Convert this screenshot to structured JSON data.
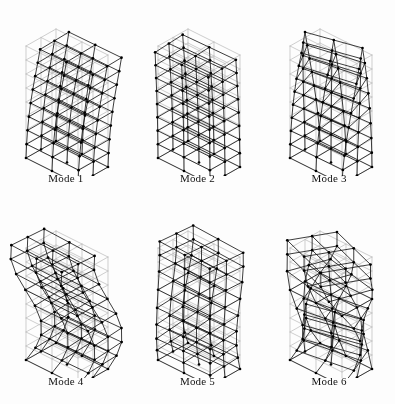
{
  "figure": {
    "type": "mode-shape-grid",
    "columns": 3,
    "rows": 2,
    "background_color": "#fdfdfd",
    "deformed_color": "#1a1a1a",
    "undeformed_color": "#b9b9b9",
    "node_color": "#000000"
  },
  "structure": {
    "description": "three-dimensional multi-storey building frame",
    "storeys": 8,
    "bays_x": 2,
    "bays_y": 2,
    "columns_per_floor": 9,
    "projection": "isometric"
  },
  "panels": [
    {
      "id": "mode-1",
      "label": "Mode 1",
      "shape": "first translational sway",
      "amp": 1.0,
      "kind": "sway",
      "dir_x": 1.0,
      "dir_y": 0.12,
      "twist": 0.05,
      "curve": 0.55,
      "phase": 0
    },
    {
      "id": "mode-2",
      "label": "Mode 2",
      "shape": "second translational sway",
      "amp": 1.0,
      "kind": "sway",
      "dir_x": 0.25,
      "dir_y": -1.0,
      "twist": 0.1,
      "curve": 0.55,
      "phase": 0
    },
    {
      "id": "mode-3",
      "label": "Mode 3",
      "shape": "first torsional",
      "amp": 0.72,
      "kind": "torsion",
      "dir_x": 0.08,
      "dir_y": 0.05,
      "twist": 1.0,
      "curve": 0.85,
      "phase": 0
    },
    {
      "id": "mode-4",
      "label": "Mode 4",
      "shape": "second mode sway with reversal",
      "amp": 1.0,
      "kind": "sway2",
      "dir_x": 0.95,
      "dir_y": 0.3,
      "twist": 0.12,
      "curve": 0.5,
      "phase": 1
    },
    {
      "id": "mode-5",
      "label": "Mode 5",
      "shape": "second mode sway transverse",
      "amp": 1.0,
      "kind": "sway2",
      "dir_x": 0.3,
      "dir_y": -0.95,
      "twist": 0.15,
      "curve": 0.5,
      "phase": 1
    },
    {
      "id": "mode-6",
      "label": "Mode 6",
      "shape": "second torsional",
      "amp": 0.8,
      "kind": "torsion2",
      "dir_x": 0.15,
      "dir_y": 0.1,
      "twist": 1.0,
      "curve": 0.5,
      "phase": 1
    }
  ]
}
